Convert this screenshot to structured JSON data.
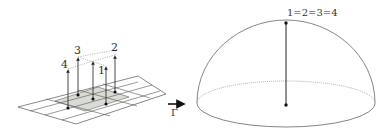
{
  "figure": {
    "left_panel": {
      "description": "Grid of 2x2 patch on a plane with vertical fiber arrows at grid points",
      "arrow_labels": [
        "4",
        "3",
        "1",
        "2"
      ],
      "points": [
        {
          "label": "4",
          "base": [
            68,
            108
          ],
          "top": [
            68,
            69
          ],
          "label_pos": [
            63,
            66
          ]
        },
        {
          "label": "3",
          "base": [
            78,
            95
          ],
          "top": [
            78,
            57
          ],
          "label_pos": [
            77,
            52
          ]
        },
        {
          "label": "",
          "base": [
            93,
            99
          ],
          "top": [
            93,
            61
          ],
          "label_pos": [
            0,
            0
          ]
        },
        {
          "label": "1",
          "base": [
            106,
            104
          ],
          "top": [
            106,
            66
          ],
          "label_pos": [
            101,
            72
          ]
        },
        {
          "label": "2",
          "base": [
            115,
            92
          ],
          "top": [
            115,
            55
          ],
          "label_pos": [
            114,
            49
          ]
        }
      ]
    },
    "map_arrow": {
      "label": "Γ"
    },
    "right_panel": {
      "description": "Hemisphere with single vertical fiber, all points identified",
      "top_label": "1=2=3=4"
    },
    "colors": {
      "line": "#555555",
      "dotted": "#999999",
      "shade": "#d9dbd5",
      "dot": "#111111",
      "arrow": "#111111"
    }
  }
}
